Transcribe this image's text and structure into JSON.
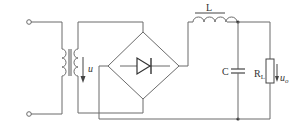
{
  "diagram": {
    "type": "circuit-schematic",
    "labels": {
      "secondary_voltage": "u",
      "inductor": "L",
      "capacitor": "C",
      "load_resistor": "R",
      "load_resistor_sub": "L",
      "output_voltage": "u",
      "output_voltage_sub": "o"
    },
    "components": [
      {
        "id": "input-terminal-top",
        "kind": "terminal"
      },
      {
        "id": "input-terminal-bottom",
        "kind": "terminal"
      },
      {
        "id": "transformer",
        "kind": "transformer"
      },
      {
        "id": "bridge-rectifier",
        "kind": "diode-bridge"
      },
      {
        "id": "inductor",
        "kind": "inductor",
        "label": "L"
      },
      {
        "id": "capacitor",
        "kind": "capacitor",
        "label": "C"
      },
      {
        "id": "load-resistor",
        "kind": "resistor",
        "label": "RL"
      }
    ],
    "colors": {
      "wire": "#6b6b6b",
      "text": "#333333",
      "background": "#ffffff"
    }
  }
}
